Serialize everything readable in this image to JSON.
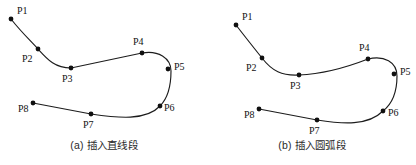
{
  "figure": {
    "background_color": "#ffffff",
    "stroke_color": "#1c1c1c",
    "dot_color": "#101010",
    "text_color": "#121212",
    "panel_count": 2
  },
  "panels": [
    {
      "id": "a",
      "caption": "(a) 插入直线段",
      "caption_index": "(a)",
      "caption_text": "插入直线段",
      "points": [
        {
          "label": "P1",
          "x": 11,
          "y": 19,
          "label_x": 17,
          "label_y": 14
        },
        {
          "label": "P2",
          "x": 38,
          "y": 49,
          "label_x": 22,
          "label_y": 62
        },
        {
          "label": "P3",
          "x": 71,
          "y": 68,
          "label_x": 62,
          "label_y": 82
        },
        {
          "label": "P4",
          "x": 142,
          "y": 53,
          "label_x": 133,
          "label_y": 45
        },
        {
          "label": "P5",
          "x": 168,
          "y": 69,
          "label_x": 174,
          "label_y": 70
        },
        {
          "label": "P6",
          "x": 160,
          "y": 106,
          "label_x": 164,
          "label_y": 111
        },
        {
          "label": "P7",
          "x": 91,
          "y": 114,
          "label_x": 83,
          "label_y": 128
        },
        {
          "label": "P8",
          "x": 33,
          "y": 103,
          "label_x": 18,
          "label_y": 112
        }
      ],
      "path": "M 11,19 C 22,33 30,40 38,49 C 48,60 55,68 71,68 L 142,53 C 158,50 171,58 171,71 C 171,86 167,99 160,106 C 146,121 118,118 91,114 L 33,103"
    },
    {
      "id": "b",
      "caption": "(b) 插入圆弧段",
      "caption_index": "(b)",
      "caption_text": "插入圆弧段",
      "points": [
        {
          "label": "P1",
          "x": 28,
          "y": 25,
          "label_x": 34,
          "label_y": 20
        },
        {
          "label": "P2",
          "x": 54,
          "y": 58,
          "label_x": 38,
          "label_y": 71
        },
        {
          "label": "P3",
          "x": 91,
          "y": 75,
          "label_x": 82,
          "label_y": 89
        },
        {
          "label": "P4",
          "x": 160,
          "y": 59,
          "label_x": 151,
          "label_y": 51
        },
        {
          "label": "P5",
          "x": 186,
          "y": 74,
          "label_x": 192,
          "label_y": 75
        },
        {
          "label": "P6",
          "x": 175,
          "y": 111,
          "label_x": 180,
          "label_y": 116
        },
        {
          "label": "P7",
          "x": 109,
          "y": 120,
          "label_x": 101,
          "label_y": 134
        },
        {
          "label": "P8",
          "x": 51,
          "y": 109,
          "label_x": 36,
          "label_y": 118
        }
      ],
      "path": "M 28,25 C 38,38 46,48 54,58 C 64,71 74,76 91,75 C 115,74 137,68 160,59 C 176,55 189,62 189,76 C 189,91 184,104 175,111 C 160,126 135,124 109,120 L 51,109"
    }
  ]
}
